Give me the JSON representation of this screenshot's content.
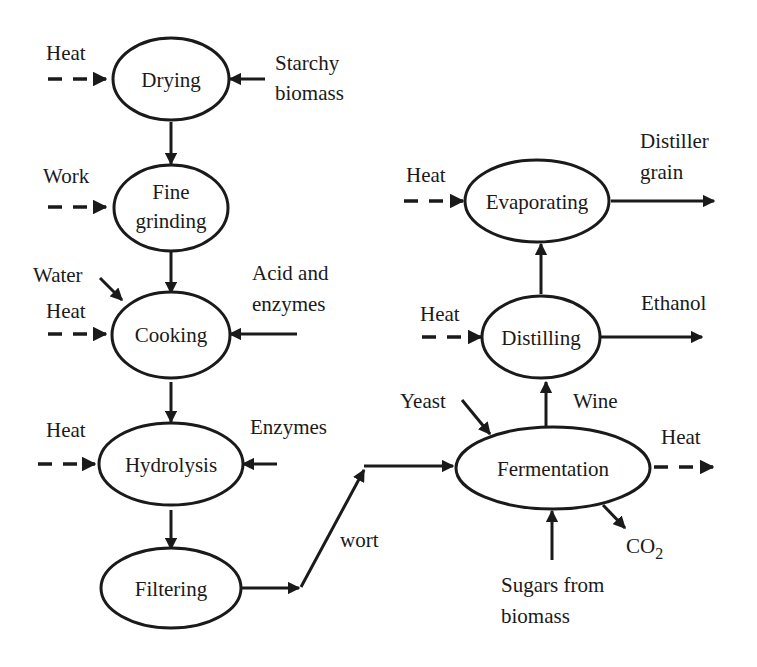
{
  "diagram": {
    "type": "process-flow",
    "nodes": {
      "drying": {
        "label": "Drying"
      },
      "fine_grinding": {
        "label_line1": "Fine",
        "label_line2": "grinding"
      },
      "cooking": {
        "label": "Cooking"
      },
      "hydrolysis": {
        "label": "Hydrolysis"
      },
      "filtering": {
        "label": "Filtering"
      },
      "fermentation": {
        "label": "Fermentation"
      },
      "distilling": {
        "label": "Distilling"
      },
      "evaporating": {
        "label": "Evaporating"
      }
    },
    "labels": {
      "drying_heat": "Heat",
      "starchy_line1": "Starchy",
      "starchy_line2": "biomass",
      "grinding_work": "Work",
      "cooking_water": "Water",
      "cooking_heat": "Heat",
      "acid_line1": "Acid and",
      "acid_line2": "enzymes",
      "hydrolysis_heat": "Heat",
      "hydrolysis_enzymes": "Enzymes",
      "wort": "wort",
      "yeast": "Yeast",
      "wine": "Wine",
      "fermentation_heat": "Heat",
      "co2_main": "CO",
      "co2_sub": "2",
      "sugars_line1": "Sugars from",
      "sugars_line2": "biomass",
      "distilling_heat": "Heat",
      "ethanol": "Ethanol",
      "evaporating_heat": "Heat",
      "distiller_line1": "Distiller",
      "distiller_line2": "grain"
    },
    "edges": [
      {
        "from": "Starchy biomass",
        "to": "Drying",
        "style": "solid"
      },
      {
        "from": "Heat",
        "to": "Drying",
        "style": "dashed"
      },
      {
        "from": "Drying",
        "to": "Fine grinding",
        "style": "solid"
      },
      {
        "from": "Work",
        "to": "Fine grinding",
        "style": "dashed"
      },
      {
        "from": "Fine grinding",
        "to": "Cooking",
        "style": "solid"
      },
      {
        "from": "Water",
        "to": "Cooking",
        "style": "solid"
      },
      {
        "from": "Heat",
        "to": "Cooking",
        "style": "dashed"
      },
      {
        "from": "Acid and enzymes",
        "to": "Cooking",
        "style": "solid"
      },
      {
        "from": "Cooking",
        "to": "Hydrolysis",
        "style": "solid"
      },
      {
        "from": "Heat",
        "to": "Hydrolysis",
        "style": "dashed"
      },
      {
        "from": "Enzymes",
        "to": "Hydrolysis",
        "style": "solid"
      },
      {
        "from": "Hydrolysis",
        "to": "Filtering",
        "style": "solid"
      },
      {
        "from": "Filtering",
        "to": "Fermentation",
        "label": "wort",
        "style": "solid"
      },
      {
        "from": "Yeast",
        "to": "Fermentation",
        "style": "solid"
      },
      {
        "from": "Sugars from biomass",
        "to": "Fermentation",
        "style": "solid"
      },
      {
        "from": "Fermentation",
        "to": "Heat",
        "style": "dashed"
      },
      {
        "from": "Fermentation",
        "to": "CO2",
        "style": "solid"
      },
      {
        "from": "Fermentation",
        "to": "Distilling",
        "label": "Wine",
        "style": "solid"
      },
      {
        "from": "Heat",
        "to": "Distilling",
        "style": "dashed"
      },
      {
        "from": "Distilling",
        "to": "Ethanol",
        "style": "solid"
      },
      {
        "from": "Distilling",
        "to": "Evaporating",
        "style": "solid"
      },
      {
        "from": "Heat",
        "to": "Evaporating",
        "style": "dashed"
      },
      {
        "from": "Evaporating",
        "to": "Distiller grain",
        "style": "solid"
      }
    ]
  }
}
